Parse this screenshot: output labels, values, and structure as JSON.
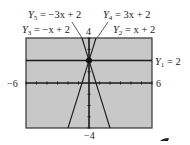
{
  "chart_data": {
    "type": "line",
    "title": "",
    "xlabel": "",
    "ylabel": "",
    "xlim": [
      -6,
      6
    ],
    "ylim": [
      -4,
      4
    ],
    "grid": false,
    "x_tick_step": 1,
    "y_tick_step": 1,
    "background_color": "#c8c8c8",
    "line_color": "#1a1a1a",
    "window_labels": {
      "xmin": "−6",
      "xmax": "6",
      "ymin": "−4",
      "ymax": "4"
    },
    "series": [
      {
        "name": "Y1",
        "label": "Y₁ = 2",
        "slope": 0,
        "intercept": 2
      },
      {
        "name": "Y2",
        "label": "Y₂ = x + 2",
        "slope": 1,
        "intercept": 2
      },
      {
        "name": "Y3",
        "label": "Y₃ = −x + 2",
        "slope": -1,
        "intercept": 2
      },
      {
        "name": "Y4",
        "label": "Y₄ = 3x + 2",
        "slope": 3,
        "intercept": 2
      },
      {
        "name": "Y5",
        "label": "Y₅ = −3x + 2",
        "slope": -3,
        "intercept": 2
      }
    ],
    "common_point": {
      "x": 0,
      "y": 2
    },
    "annotations": [
      {
        "text": "Y₅ = −3x + 2",
        "position": "top-left"
      },
      {
        "text": "Y₃ = −x + 2",
        "position": "upper-left"
      },
      {
        "text": "Y₄ = 3x + 2",
        "position": "top-right"
      },
      {
        "text": "Y₂ = x + 2",
        "position": "upper-right"
      },
      {
        "text": "Y₁ = 2",
        "position": "right"
      }
    ]
  },
  "labels": {
    "y5": {
      "name": "Y",
      "sub": "5",
      "rest": " = −3x + 2"
    },
    "y3": {
      "name": "Y",
      "sub": "3",
      "rest": " = −x + 2"
    },
    "y4": {
      "name": "Y",
      "sub": "4",
      "rest": " = 3x + 2"
    },
    "y2": {
      "name": "Y",
      "sub": "2",
      "rest": " = x + 2"
    },
    "y1": {
      "name": "Y",
      "sub": "1",
      "rest": " = 2"
    },
    "ymax": "4",
    "ymin": "−4",
    "xmin": "−6",
    "xmax": "6"
  }
}
